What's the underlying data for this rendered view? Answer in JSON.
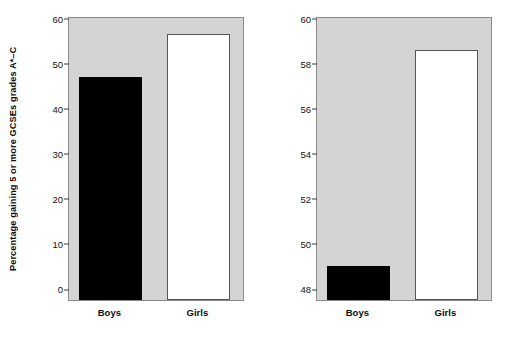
{
  "figure": {
    "background_color": "#ffffff",
    "plot_background_color": "#d4d4d4",
    "axis_color": "#8a8a8a"
  },
  "chart_data": [
    {
      "type": "bar",
      "title": "",
      "panel_name": "full-scale-axis",
      "categories": [
        "Boys",
        "Girls"
      ],
      "values": [
        49.5,
        59.1
      ],
      "bar_colors": [
        "#000000",
        "#ffffff"
      ],
      "xlabel": "",
      "ylabel": "Percentage gaining 5 or more GCSEs grades A*–C",
      "ylim": [
        0,
        63
      ],
      "yticks": [
        0,
        10,
        20,
        30,
        40,
        50,
        60
      ],
      "ytick_labels": [
        "0",
        "10",
        "20",
        "30",
        "40",
        "50",
        "60"
      ],
      "grid": false,
      "legend": "none"
    },
    {
      "type": "bar",
      "title": "",
      "panel_name": "truncated-scale-axis",
      "categories": [
        "Boys",
        "Girls"
      ],
      "values": [
        49.5,
        59.1
      ],
      "bar_colors": [
        "#000000",
        "#ffffff"
      ],
      "xlabel": "",
      "ylabel": "Percentage gaining 5 or more GCSEs grades A*–C",
      "ylim": [
        48,
        60.6
      ],
      "yticks": [
        48,
        50,
        52,
        54,
        56,
        58,
        60
      ],
      "ytick_labels": [
        "48",
        "50",
        "52",
        "54",
        "56",
        "58",
        "60"
      ],
      "grid": false,
      "legend": "none"
    }
  ]
}
